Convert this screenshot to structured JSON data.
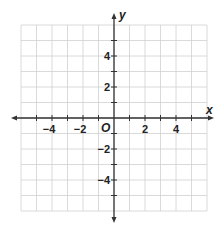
{
  "chart_data": {
    "type": "scatter",
    "title": "",
    "xlabel": "x",
    "ylabel": "y",
    "origin_label": "O",
    "xlim": [
      -6,
      6
    ],
    "ylim": [
      -6,
      6
    ],
    "grid": true,
    "grid_step": 1,
    "x_ticks": [
      -4,
      -2,
      2,
      4
    ],
    "y_ticks": [
      4,
      2,
      -2,
      -4
    ],
    "x_tick_labels": [
      "−4",
      "−2",
      "2",
      "4"
    ],
    "y_tick_labels": [
      "4",
      "2",
      "−2",
      "−4"
    ],
    "series": [],
    "legend": null
  },
  "colors": {
    "grid": "#d0d0d0",
    "axis": "#333333",
    "text": "#222222"
  }
}
